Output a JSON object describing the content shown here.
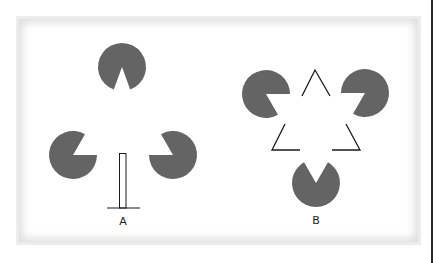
{
  "figure": {
    "fill_color": "#646464",
    "line_color": "#1a1a1a",
    "panels": [
      {
        "label": "A",
        "pacmen": [
          {
            "cx": 122,
            "cy": 67,
            "r": 24,
            "notch": "down"
          },
          {
            "cx": 73,
            "cy": 155,
            "r": 24,
            "notch": "upper-right"
          },
          {
            "cx": 173,
            "cy": 155,
            "r": 24,
            "notch": "upper-left"
          }
        ],
        "stand": {
          "rect": [
            119,
            153,
            7,
            55
          ],
          "base": [
            107,
            208,
            140,
            208
          ]
        }
      },
      {
        "label": "B",
        "pacmen": [
          {
            "cx": 266,
            "cy": 94,
            "r": 24,
            "notch": "lower-right"
          },
          {
            "cx": 365,
            "cy": 93,
            "r": 24,
            "notch": "lower-left"
          },
          {
            "cx": 316,
            "cy": 183,
            "r": 24,
            "notch": "up"
          }
        ],
        "triangle_corners": [
          "top",
          "bottom-left",
          "bottom-right"
        ]
      }
    ]
  }
}
